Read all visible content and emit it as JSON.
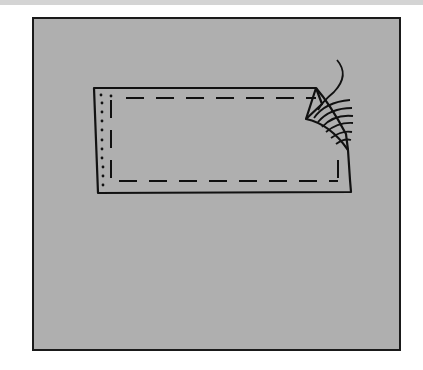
{
  "figure": {
    "colors": {
      "background": "#ffffff",
      "top_strip": "#d4d4d4",
      "panel_fill": "#afafaf",
      "panel_border": "#1a1a1a",
      "line": "#111111"
    },
    "elements": [
      {
        "name": "outer-panel",
        "shape": "square frame"
      },
      {
        "name": "fabric-rectangle",
        "shape": "rectangle with folded top-right corner"
      },
      {
        "name": "dashed-stitch-line",
        "style": "dashed",
        "path": "inner rectangle"
      },
      {
        "name": "dotted-edge-line",
        "style": "dotted",
        "path": "left edge"
      },
      {
        "name": "folded-corner",
        "shape": "triangular fold"
      },
      {
        "name": "thread-strands",
        "count": 6,
        "style": "curved lines"
      }
    ]
  }
}
